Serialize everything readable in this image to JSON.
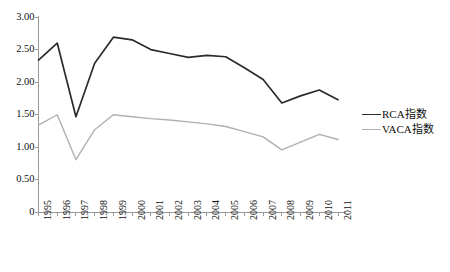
{
  "chart_data": {
    "type": "line",
    "title": "",
    "subtitle": "",
    "xlabel": "",
    "ylabel": "",
    "categories": [
      "1995",
      "1996",
      "1997",
      "1998",
      "1999",
      "2000",
      "2001",
      "2002",
      "2003",
      "2004",
      "2005",
      "2006",
      "2007",
      "2008",
      "2009",
      "2010",
      "2011"
    ],
    "series": [
      {
        "name": "RCA指数",
        "color": "#2b2b2b",
        "values": [
          2.34,
          2.6,
          1.47,
          2.29,
          2.69,
          2.65,
          2.5,
          2.44,
          2.38,
          2.41,
          2.39,
          2.22,
          2.04,
          1.68,
          1.79,
          1.88,
          1.73
        ]
      },
      {
        "name": "VACA指数",
        "color": "#b0b0b0",
        "values": [
          1.34,
          1.5,
          0.81,
          1.27,
          1.5,
          1.47,
          1.44,
          1.42,
          1.39,
          1.36,
          1.32,
          1.24,
          1.16,
          0.96,
          1.08,
          1.2,
          1.12
        ]
      }
    ],
    "ylim": [
      0,
      3.0
    ],
    "ytick_labels": [
      "0",
      "0.50",
      "1.00",
      "1.50",
      "2.00",
      "2.50",
      "3.00"
    ],
    "ytick_values": [
      0,
      0.5,
      1.0,
      1.5,
      2.0,
      2.5,
      3.0
    ],
    "grid": false,
    "legend_position": "right",
    "axis_color": "#9a9a9a"
  }
}
